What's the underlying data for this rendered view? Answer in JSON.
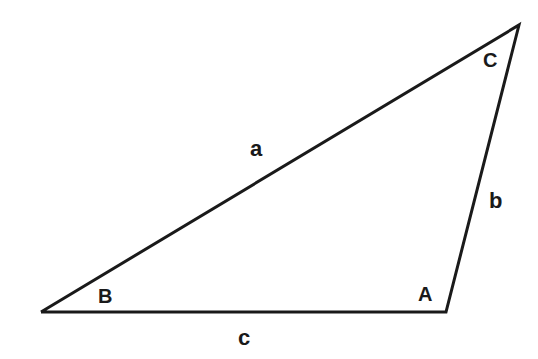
{
  "diagram": {
    "type": "triangle",
    "background_color": "#ffffff",
    "stroke_color": "#1a1a1a",
    "stroke_width": 3,
    "vertices": [
      {
        "id": "B",
        "label": "B",
        "x": 41,
        "y": 312,
        "label_x": 98,
        "label_y": 286
      },
      {
        "id": "A",
        "label": "A",
        "x": 446,
        "y": 312,
        "label_x": 418,
        "label_y": 284
      },
      {
        "id": "C",
        "label": "C",
        "x": 519,
        "y": 25,
        "label_x": 483,
        "label_y": 50
      }
    ],
    "sides": [
      {
        "id": "a",
        "label": "a",
        "from": "B",
        "to": "C",
        "label_x": 250,
        "label_y": 138
      },
      {
        "id": "b",
        "label": "b",
        "from": "C",
        "to": "A",
        "label_x": 489,
        "label_y": 190
      },
      {
        "id": "c",
        "label": "c",
        "from": "A",
        "to": "B",
        "label_x": 238,
        "label_y": 327
      }
    ],
    "path": "M 41 312 L 519 25 L 446 312 Z"
  }
}
